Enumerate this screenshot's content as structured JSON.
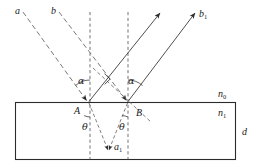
{
  "figure": {
    "colors": {
      "stroke": "#3b3b3b",
      "slab_border": "#2b2b2b",
      "background": "#ffffff",
      "label": "#1a1a1a"
    },
    "slab": {
      "x": 15,
      "y": 102,
      "width": 221,
      "height": 58,
      "thickness_label": "d",
      "medium_outside_label": "n",
      "medium_outside_sub": "0",
      "medium_inside_label": "n",
      "medium_inside_sub": "1"
    },
    "points": [
      {
        "name": "A",
        "label": "A",
        "x": 88,
        "y": 102,
        "label_x": 74,
        "label_y": 106
      },
      {
        "name": "B",
        "label": "B",
        "x": 128,
        "y": 102,
        "label_x": 136,
        "label_y": 108
      }
    ],
    "ray_labels": [
      {
        "name": "incident-ray-a",
        "label": "a",
        "sub": "",
        "x": 15,
        "y": 6
      },
      {
        "name": "incident-ray-b",
        "label": "b",
        "sub": "",
        "x": 51,
        "y": 6
      },
      {
        "name": "reflected-ray-b1",
        "label": "b",
        "sub": "1",
        "x": 199,
        "y": 9
      },
      {
        "name": "refracted-ray-a1",
        "label": "a",
        "sub": "1",
        "x": 114,
        "y": 142
      }
    ],
    "angle_labels": [
      {
        "name": "angle-alpha-left",
        "label": "α",
        "x": 78,
        "y": 76
      },
      {
        "name": "angle-alpha-right",
        "label": "α",
        "x": 128,
        "y": 76
      },
      {
        "name": "angle-theta-left",
        "label": "θ",
        "x": 82,
        "y": 122
      },
      {
        "name": "angle-theta-right",
        "label": "θ",
        "x": 119,
        "y": 122
      }
    ],
    "normals": [
      {
        "name": "normal-at-A",
        "x": 90,
        "y1": 12,
        "y2": 160
      },
      {
        "name": "normal-at-B",
        "x": 128,
        "y1": 12,
        "y2": 160
      }
    ]
  }
}
